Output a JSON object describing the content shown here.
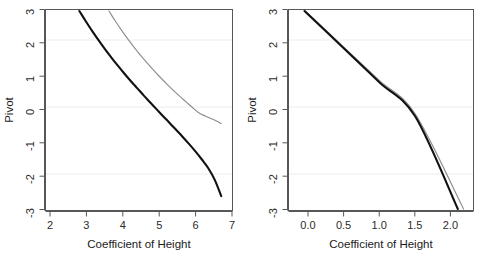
{
  "figure": {
    "width": 487,
    "height": 258,
    "background": "#ffffff",
    "panel_count": 2
  },
  "chart_data": [
    {
      "type": "line",
      "panel": "left",
      "title": "",
      "xlabel": "Coefficient of Height",
      "ylabel": "Pivot",
      "xlim": [
        1.55,
        7.35
      ],
      "ylim": [
        -3.35,
        3.35
      ],
      "xticks": [
        2,
        3,
        4,
        5,
        6,
        7
      ],
      "xticklabels": [
        "2",
        "3",
        "4",
        "5",
        "6",
        "7"
      ],
      "yticks": [
        3,
        2,
        1,
        0,
        -1,
        -2,
        -3
      ],
      "yticklabels": [
        "3",
        "2",
        "1",
        "0",
        "-1",
        "-2",
        "-3"
      ],
      "grid": true,
      "gridlines_y": [
        2,
        0,
        -2
      ],
      "grid_color": "#ececed",
      "legend": null,
      "series": [
        {
          "name": "pivot-curve-thick",
          "color": "#111111",
          "linewidth": 2.1,
          "x": [
            2.6,
            2.8,
            3.0,
            3.2,
            3.4,
            3.6,
            3.8,
            4.0,
            4.2,
            4.4,
            4.6,
            4.8,
            5.0,
            5.2,
            5.4,
            5.6,
            5.8,
            6.0,
            6.2,
            6.4,
            6.6,
            6.8,
            7.0
          ],
          "y": [
            3.3,
            2.96,
            2.63,
            2.32,
            2.02,
            1.74,
            1.47,
            1.21,
            0.96,
            0.72,
            0.48,
            0.25,
            0.02,
            -0.21,
            -0.43,
            -0.66,
            -0.89,
            -1.13,
            -1.38,
            -1.65,
            -1.94,
            -2.33,
            -2.87
          ]
        },
        {
          "name": "pivot-curve-thin",
          "color": "#8e8e8e",
          "linewidth": 1.15,
          "x": [
            3.52,
            3.7,
            3.9,
            4.1,
            4.3,
            4.5,
            4.7,
            4.9,
            5.1,
            5.3,
            5.5,
            5.7,
            5.9,
            6.1,
            6.3,
            6.5,
            6.7,
            6.9,
            7.0
          ],
          "y": [
            3.3,
            2.99,
            2.67,
            2.37,
            2.09,
            1.82,
            1.57,
            1.33,
            1.1,
            0.88,
            0.67,
            0.47,
            0.28,
            0.09,
            -0.09,
            -0.2,
            -0.29,
            -0.39,
            -0.45
          ]
        }
      ]
    },
    {
      "type": "line",
      "panel": "right",
      "title": "",
      "xlabel": "Coefficient of Height",
      "ylabel": "Pivot",
      "xlim": [
        -0.28,
        2.32
      ],
      "ylim": [
        -3.35,
        3.35
      ],
      "xticks": [
        0.0,
        0.5,
        1.0,
        1.5,
        2.0
      ],
      "xticklabels": [
        "0.0",
        "0.5",
        "1.0",
        "1.5",
        "2.0"
      ],
      "yticks": [
        3,
        2,
        1,
        0,
        -1,
        -2,
        -3
      ],
      "yticklabels": [
        "3",
        "2",
        "1",
        "0",
        "-1",
        "-2",
        "-3"
      ],
      "grid": true,
      "gridlines_y": [
        2,
        0,
        -2
      ],
      "grid_color": "#ececed",
      "legend": null,
      "series": [
        {
          "name": "pivot-line-thick",
          "color": "#111111",
          "linewidth": 2.0,
          "x": [
            -0.055,
            0.5,
            1.0,
            1.5,
            2.1
          ],
          "y": [
            3.3,
            2.05,
            0.92,
            -0.21,
            -3.3
          ]
        },
        {
          "name": "pivot-line-thin",
          "color": "#8e8e8e",
          "linewidth": 1.15,
          "x": [
            -0.045,
            0.5,
            1.0,
            1.5,
            2.18
          ],
          "y": [
            3.3,
            2.09,
            0.98,
            -0.13,
            -3.3
          ]
        }
      ]
    }
  ]
}
